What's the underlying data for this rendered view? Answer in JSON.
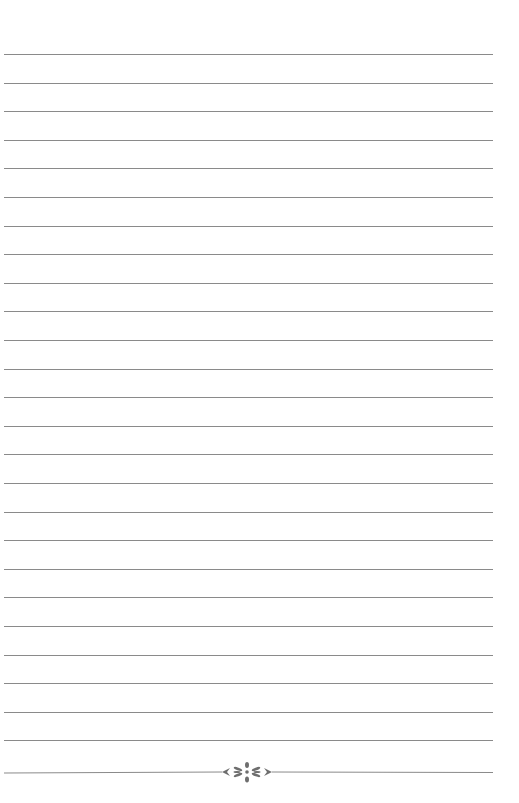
{
  "page": {
    "type": "lined-notebook-page",
    "background_color": "#ffffff",
    "rule_color": "#8a8a8a",
    "ornament_color": "#6e6e6e",
    "rule_count": 25,
    "first_rule_y": 54,
    "rule_spacing": 28.6,
    "rules_left": 4,
    "rules_right": 493
  },
  "footer": {
    "ornament": "flower-divider-icon",
    "line_y": 772
  }
}
